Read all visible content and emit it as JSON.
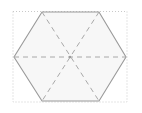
{
  "figure": {
    "canvas": {
      "width": 142,
      "height": 113,
      "background": "#ffffff"
    },
    "bounding_box": {
      "name": "dotted-bounding-box",
      "x": 13,
      "y": 11.5,
      "width": 114,
      "height": 90.5,
      "stroke": "#c9c9c9",
      "stroke_width": 1,
      "dash": "1,2",
      "fill": "none"
    },
    "hexagon": {
      "name": "hexagon",
      "orientation": "flat-top",
      "center": {
        "x": 70,
        "y": 57
      },
      "vertices": [
        {
          "label": "top-left",
          "x": 42,
          "y": 12
        },
        {
          "label": "top-right",
          "x": 99,
          "y": 12
        },
        {
          "label": "right",
          "x": 126,
          "y": 57
        },
        {
          "label": "bottom-right",
          "x": 99,
          "y": 101
        },
        {
          "label": "bottom-left",
          "x": 42,
          "y": 101
        },
        {
          "label": "left",
          "x": 14,
          "y": 57
        }
      ],
      "points": "42,12 99,12 126,57 99,101 42,101 14,57",
      "fill": "#f7f7f7",
      "stroke": "#9a9a9a",
      "stroke_width": 1.1
    },
    "diagonals": {
      "name": "dashed-diagonals",
      "stroke": "#a8a8a8",
      "stroke_width": 1,
      "dash": "5,4",
      "count": 3,
      "lines": [
        {
          "label": "horizontal-left-to-right",
          "x1": 14,
          "y1": 57,
          "x2": 126,
          "y2": 57
        },
        {
          "label": "top-left-to-bottom-right",
          "x1": 42,
          "y1": 12,
          "x2": 99,
          "y2": 101
        },
        {
          "label": "top-right-to-bottom-left",
          "x1": 99,
          "y1": 12,
          "x2": 42,
          "y2": 101
        }
      ]
    },
    "center_marker": {
      "name": "center-point",
      "x": 70,
      "y": 57,
      "radius": 1.2,
      "fill": "#9a9a9a"
    }
  }
}
